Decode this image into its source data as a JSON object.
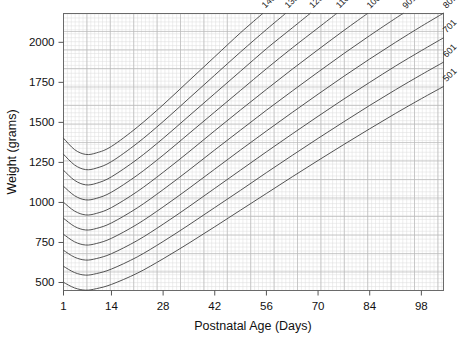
{
  "chart_data": {
    "type": "line",
    "title": "",
    "xlabel": "Postnatal Age (Days)",
    "ylabel": "Weight (grams)",
    "xlim": [
      1,
      104
    ],
    "ylim": [
      450,
      2180
    ],
    "xticks": [
      1,
      14,
      28,
      42,
      56,
      70,
      84,
      98
    ],
    "xtick_labels": [
      "1",
      "14",
      "28",
      "42",
      "56",
      "70",
      "84",
      "98"
    ],
    "yticks": [
      500,
      750,
      1000,
      1250,
      1500,
      1750,
      2000
    ],
    "ytick_labels": [
      "500",
      "750",
      "1000",
      "1250",
      "1500",
      "1750",
      "2000"
    ],
    "grid": true,
    "grid_minor": true,
    "legend": "inline-curve-labels",
    "series": [
      {
        "name": "1401",
        "label": "1401",
        "birth_weight": 1401,
        "x": [
          1,
          4,
          7,
          10,
          14,
          21,
          28,
          35,
          42,
          49,
          56,
          63,
          70
        ],
        "y": [
          1401,
          1330,
          1300,
          1310,
          1350,
          1470,
          1610,
          1760,
          1910,
          2060,
          2200,
          2340,
          2480
        ]
      },
      {
        "name": "1301",
        "label": "1301",
        "birth_weight": 1301,
        "x": [
          1,
          4,
          7,
          10,
          14,
          21,
          28,
          35,
          42,
          49,
          56,
          63,
          70,
          77
        ],
        "y": [
          1301,
          1234,
          1205,
          1215,
          1255,
          1370,
          1505,
          1650,
          1795,
          1940,
          2080,
          2215,
          2350,
          2480
        ]
      },
      {
        "name": "1201",
        "label": "1201",
        "birth_weight": 1201,
        "x": [
          1,
          4,
          7,
          10,
          14,
          21,
          28,
          35,
          42,
          49,
          56,
          63,
          70,
          77,
          84
        ],
        "y": [
          1201,
          1138,
          1110,
          1120,
          1160,
          1270,
          1400,
          1540,
          1680,
          1820,
          1960,
          2090,
          2220,
          2350,
          2475
        ]
      },
      {
        "name": "1101",
        "label": "1101",
        "birth_weight": 1101,
        "x": [
          1,
          4,
          7,
          10,
          14,
          21,
          28,
          35,
          42,
          49,
          56,
          63,
          70,
          77,
          84,
          91
        ],
        "y": [
          1101,
          1042,
          1016,
          1026,
          1064,
          1170,
          1295,
          1430,
          1565,
          1700,
          1835,
          1965,
          2090,
          2215,
          2335,
          2455
        ]
      },
      {
        "name": "1001",
        "label": "1001",
        "birth_weight": 1001,
        "x": [
          1,
          4,
          7,
          10,
          14,
          21,
          28,
          35,
          42,
          49,
          56,
          63,
          70,
          77,
          84,
          91,
          98
        ],
        "y": [
          1001,
          946,
          922,
          932,
          968,
          1068,
          1188,
          1316,
          1448,
          1578,
          1706,
          1832,
          1954,
          2074,
          2190,
          2300,
          2405
        ]
      },
      {
        "name": "901",
        "label": "901",
        "birth_weight": 901,
        "x": [
          1,
          4,
          7,
          10,
          14,
          21,
          28,
          35,
          42,
          49,
          56,
          63,
          70,
          77,
          84,
          91,
          98,
          104
        ],
        "y": [
          901,
          850,
          828,
          838,
          872,
          966,
          1080,
          1202,
          1328,
          1452,
          1576,
          1696,
          1814,
          1930,
          2042,
          2150,
          2252,
          2336
        ]
      },
      {
        "name": "801",
        "label": "801",
        "birth_weight": 801,
        "x": [
          1,
          4,
          7,
          10,
          14,
          21,
          28,
          35,
          42,
          49,
          56,
          63,
          70,
          77,
          84,
          91,
          98,
          104
        ],
        "y": [
          801,
          754,
          734,
          744,
          776,
          864,
          972,
          1088,
          1208,
          1328,
          1446,
          1562,
          1676,
          1788,
          1896,
          2000,
          2100,
          2182
        ]
      },
      {
        "name": "701",
        "label": "701",
        "birth_weight": 701,
        "x": [
          1,
          4,
          7,
          10,
          14,
          21,
          28,
          35,
          42,
          49,
          56,
          63,
          70,
          77,
          84,
          91,
          98,
          104
        ],
        "y": [
          701,
          658,
          640,
          650,
          680,
          762,
          864,
          974,
          1088,
          1202,
          1316,
          1428,
          1538,
          1646,
          1750,
          1852,
          1948,
          2028
        ]
      },
      {
        "name": "601",
        "label": "601",
        "birth_weight": 601,
        "x": [
          1,
          4,
          7,
          10,
          14,
          21,
          28,
          35,
          42,
          49,
          56,
          63,
          70,
          77,
          84,
          91,
          98,
          104
        ],
        "y": [
          601,
          562,
          546,
          556,
          584,
          660,
          756,
          860,
          968,
          1076,
          1186,
          1294,
          1400,
          1504,
          1606,
          1704,
          1798,
          1876
        ]
      },
      {
        "name": "501",
        "label": "501",
        "birth_weight": 501,
        "x": [
          1,
          4,
          7,
          10,
          14,
          21,
          28,
          35,
          42,
          49,
          56,
          63,
          70,
          77,
          84,
          91,
          98,
          104
        ],
        "y": [
          501,
          466,
          452,
          462,
          488,
          558,
          648,
          746,
          848,
          952,
          1056,
          1160,
          1262,
          1362,
          1460,
          1556,
          1648,
          1724
        ]
      }
    ],
    "curve_label_rotation_deg": -45,
    "colors": {
      "curve": "#4a4a4a",
      "grid_major": "#b9b9b9",
      "grid_minor": "#dcdcdc",
      "axis": "#555555",
      "background": "#ffffff",
      "text": "#111111"
    }
  }
}
